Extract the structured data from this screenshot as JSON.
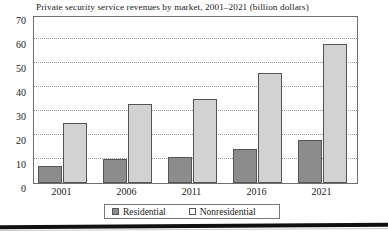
{
  "chart_data": {
    "type": "bar",
    "title": "Private security service revenues by market, 2001–2021 (billion dollars)",
    "xlabel": "",
    "ylabel": "",
    "categories": [
      "2001",
      "2006",
      "2011",
      "2016",
      "2021"
    ],
    "series": [
      {
        "name": "Residential",
        "values": [
          7,
          10,
          11,
          14,
          18
        ],
        "color": "#8c8c8c"
      },
      {
        "name": "Nonresidential",
        "values": [
          25,
          33,
          35,
          46,
          58
        ],
        "color": "#d2d2d2"
      }
    ],
    "ylim": [
      0,
      70
    ],
    "ytick_labels": [
      "0",
      "10",
      "20",
      "30",
      "40",
      "50",
      "60",
      "70"
    ],
    "ytick_values": [
      0,
      10,
      20,
      30,
      40,
      50,
      60,
      70
    ],
    "grid": true,
    "grid_style": "dotted",
    "legend_position": "bottom",
    "legend_entries": [
      "Residential",
      "Nonresidential"
    ]
  }
}
